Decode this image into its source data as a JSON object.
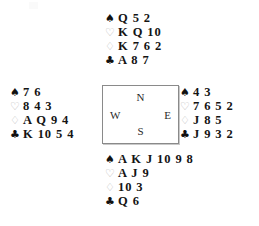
{
  "diagram": {
    "suits": [
      {
        "key": "spades",
        "name": "spade-suit-symbol",
        "glyph": "♠",
        "style": "filled"
      },
      {
        "key": "hearts",
        "name": "heart-suit-symbol",
        "glyph": "♡",
        "style": "outline"
      },
      {
        "key": "diamonds",
        "name": "diamond-suit-symbol",
        "glyph": "♢",
        "style": "outline"
      },
      {
        "key": "clubs",
        "name": "club-suit-symbol",
        "glyph": "♣",
        "style": "filled"
      }
    ],
    "colors": {
      "filled_suit": "#111111",
      "outline_suit": "#b9b9b9",
      "card_text": "#141414",
      "box_border": "#8a8a8a",
      "background": "#ffffff"
    },
    "compass": {
      "north": "N",
      "east": "E",
      "south": "S",
      "west": "W"
    },
    "hands": {
      "north": {
        "label": "North",
        "spades": "Q 5 2",
        "hearts": "K Q 10",
        "diamonds": "K 7 6 2",
        "clubs": "A 8 7"
      },
      "west": {
        "label": "West",
        "spades": "7 6",
        "hearts": "8 4 3",
        "diamonds": "A Q 9 4",
        "clubs": "K 10 5 4"
      },
      "east": {
        "label": "East",
        "spades": "4 3",
        "hearts": "7 6 5 2",
        "diamonds": "J 8 5",
        "clubs": "J 9 3 2"
      },
      "south": {
        "label": "South",
        "spades": "A K J 10 9 8",
        "hearts": "A J 9",
        "diamonds": "10 3",
        "clubs": "Q 6"
      }
    }
  }
}
